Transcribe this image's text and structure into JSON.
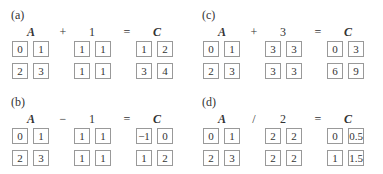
{
  "panels": [
    {
      "label": "(a)",
      "lhs": "A",
      "op": "+",
      "operand": "1",
      "eq": "=",
      "rhs": "C",
      "A": [
        "0",
        "1",
        "2",
        "3"
      ],
      "B": [
        "1",
        "1",
        "1",
        "1"
      ],
      "C": [
        "1",
        "2",
        "3",
        "4"
      ]
    },
    {
      "label": "(c)",
      "lhs": "A",
      "op": "+",
      "operand": "3",
      "eq": "=",
      "rhs": "C",
      "A": [
        "0",
        "1",
        "2",
        "3"
      ],
      "B": [
        "3",
        "3",
        "3",
        "3"
      ],
      "C": [
        "0",
        "3",
        "6",
        "9"
      ]
    },
    {
      "label": "(b)",
      "lhs": "A",
      "op": "−",
      "operand": "1",
      "eq": "=",
      "rhs": "C",
      "A": [
        "0",
        "1",
        "2",
        "3"
      ],
      "B": [
        "1",
        "1",
        "1",
        "1"
      ],
      "C": [
        "−1",
        "0",
        "1",
        "2"
      ]
    },
    {
      "label": "(d)",
      "lhs": "A",
      "op": "/",
      "operand": "2",
      "eq": "=",
      "rhs": "C",
      "A": [
        "0",
        "1",
        "2",
        "3"
      ],
      "B": [
        "2",
        "2",
        "2",
        "2"
      ],
      "C": [
        "0",
        "0.5",
        "1",
        "1.5"
      ]
    }
  ]
}
